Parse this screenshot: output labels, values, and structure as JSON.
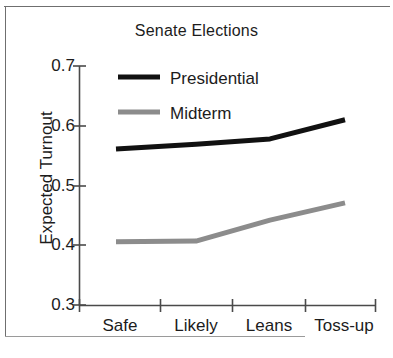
{
  "chart_data": {
    "type": "line",
    "title": "Senate Elections",
    "xlabel": "",
    "ylabel": "Expected Turnout",
    "categories": [
      "Safe",
      "Likely",
      "Leans",
      "Toss-up"
    ],
    "ylim": [
      0.3,
      0.7
    ],
    "yticks": [
      "0.7",
      "0.6",
      "0.5",
      "0.4",
      "0.3"
    ],
    "ytick_values": [
      0.7,
      0.6,
      0.5,
      0.4,
      0.3
    ],
    "grid": false,
    "legend_position": "upper left",
    "series": [
      {
        "name": "Presidential",
        "color": "#111111",
        "values": [
          0.561,
          0.569,
          0.578,
          0.61
        ]
      },
      {
        "name": "Midterm",
        "color": "#8c8c8c",
        "values": [
          0.406,
          0.407,
          0.442,
          0.471
        ]
      }
    ]
  },
  "axis": {
    "y_ticks": [
      {
        "label": "0.7",
        "value": 0.7
      },
      {
        "label": "0.6",
        "value": 0.6
      },
      {
        "label": "0.5",
        "value": 0.5
      },
      {
        "label": "0.4",
        "value": 0.4
      },
      {
        "label": "0.3",
        "value": 0.3
      }
    ],
    "x_ticks": [
      {
        "label": "Safe"
      },
      {
        "label": "Likely"
      },
      {
        "label": "Leans"
      },
      {
        "label": "Toss-up"
      }
    ]
  },
  "legend": {
    "entries": [
      {
        "label": "Presidential",
        "color": "#111111"
      },
      {
        "label": "Midterm",
        "color": "#8c8c8c"
      }
    ]
  }
}
